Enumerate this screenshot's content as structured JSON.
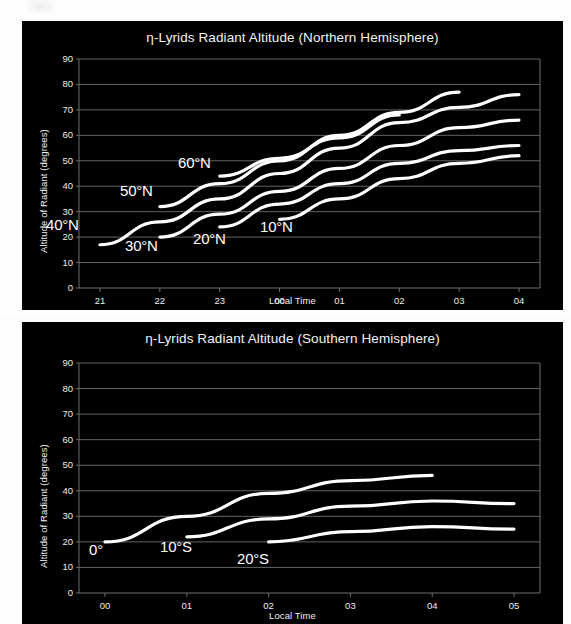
{
  "page": {
    "background_color": "#ffffff",
    "panel_color": "#000000",
    "line_color": "#ffffff",
    "grid_color": "#6e6e6e",
    "text_color": "#f0f0f0"
  },
  "charts": [
    {
      "id": "north",
      "title": "η-Lyrids Radiant Altitude (Northern Hemisphere)",
      "xlabel": "Local Time",
      "ylabel": "Altitude of Radiant (degrees)",
      "yticks": [
        "90",
        "80",
        "70",
        "60",
        "50",
        "40",
        "30",
        "20",
        "10",
        "0"
      ],
      "xticks": [
        "21",
        "22",
        "23",
        "00",
        "01",
        "02",
        "03",
        "04"
      ],
      "series_labels": [
        "40°N",
        "30°N",
        "20°N",
        "10°N",
        "50°N",
        "60°N"
      ]
    },
    {
      "id": "south",
      "title": "η-Lyrids Radiant Altitude (Southern Hemisphere)",
      "xlabel": "Local Time",
      "ylabel": "Altitude of Radiant (degrees)",
      "yticks": [
        "90",
        "80",
        "70",
        "60",
        "50",
        "40",
        "30",
        "20",
        "10",
        "0"
      ],
      "xticks": [
        "00",
        "01",
        "02",
        "03",
        "04",
        "05"
      ],
      "series_labels": [
        "0°",
        "10°S",
        "20°S"
      ]
    }
  ],
  "chart_data": [
    {
      "type": "line",
      "title": "η-Lyrids Radiant Altitude (Northern Hemisphere)",
      "xlabel": "Local Time",
      "ylabel": "Altitude of Radiant (degrees)",
      "x": [
        "21",
        "22",
        "23",
        "00",
        "01",
        "02",
        "03",
        "04"
      ],
      "xlim": [
        20.5,
        4.5
      ],
      "ylim": [
        0,
        90
      ],
      "ytick_step": 10,
      "grid": "horizontal",
      "legend": "inline-labels",
      "series": [
        {
          "name": "60°N",
          "x": [
            "23",
            "00",
            "01",
            "02"
          ],
          "values": [
            44,
            51,
            59,
            68
          ]
        },
        {
          "name": "50°N",
          "x": [
            "22",
            "23",
            "00",
            "01",
            "02",
            "03"
          ],
          "values": [
            32,
            41,
            50,
            60,
            69,
            77
          ]
        },
        {
          "name": "40°N",
          "x": [
            "21",
            "22",
            "23",
            "00",
            "01",
            "02",
            "03",
            "04"
          ],
          "values": [
            17,
            26,
            35,
            45,
            55,
            65,
            71,
            76
          ]
        },
        {
          "name": "30°N",
          "x": [
            "22",
            "23",
            "00",
            "01",
            "02",
            "03",
            "04"
          ],
          "values": [
            20,
            29,
            38,
            47,
            56,
            63,
            66
          ]
        },
        {
          "name": "20°N",
          "x": [
            "23",
            "00",
            "01",
            "02",
            "03",
            "04"
          ],
          "values": [
            24,
            33,
            41,
            49,
            54,
            56
          ]
        },
        {
          "name": "10°N",
          "x": [
            "00",
            "01",
            "02",
            "03",
            "04"
          ],
          "values": [
            27,
            35,
            43,
            49,
            52
          ]
        }
      ]
    },
    {
      "type": "line",
      "title": "η-Lyrids Radiant Altitude (Southern Hemisphere)",
      "xlabel": "Local Time",
      "ylabel": "Altitude of Radiant (degrees)",
      "x": [
        "00",
        "01",
        "02",
        "03",
        "04",
        "05"
      ],
      "xlim": [
        23.5,
        5.5
      ],
      "ylim": [
        0,
        90
      ],
      "ytick_step": 10,
      "grid": "horizontal",
      "legend": "inline-labels",
      "series": [
        {
          "name": "0°",
          "x": [
            "00",
            "01",
            "02",
            "03",
            "04"
          ],
          "values": [
            20,
            30,
            39,
            44,
            46
          ]
        },
        {
          "name": "10°S",
          "x": [
            "01",
            "02",
            "03",
            "04",
            "05"
          ],
          "values": [
            22,
            29,
            34,
            36,
            35
          ]
        },
        {
          "name": "20°S",
          "x": [
            "02",
            "03",
            "04",
            "05"
          ],
          "values": [
            20,
            24,
            26,
            25
          ]
        }
      ]
    }
  ]
}
